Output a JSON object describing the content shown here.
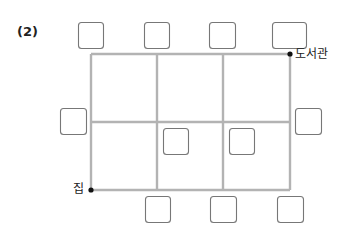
{
  "problem_number": "(2)",
  "places": {
    "start": "집",
    "end": "도서관"
  },
  "colors": {
    "grid_line": "#b3b3b3",
    "box_border": "#777777",
    "text": "#222222",
    "dot": "#111111"
  },
  "grid": {
    "columns": 3,
    "rows": 2,
    "x_lines": [
      91,
      157,
      223,
      290
    ],
    "y_lines": [
      54,
      122,
      190
    ]
  },
  "answer_boxes": [
    {
      "id": "top-1",
      "x": 78,
      "y": 22,
      "w": 25,
      "h": 26
    },
    {
      "id": "top-2",
      "x": 144,
      "y": 22,
      "w": 25,
      "h": 26
    },
    {
      "id": "top-3",
      "x": 209,
      "y": 22,
      "w": 26,
      "h": 26
    },
    {
      "id": "top-4",
      "x": 272,
      "y": 22,
      "w": 34,
      "h": 26
    },
    {
      "id": "left-1",
      "x": 60,
      "y": 108,
      "w": 26,
      "h": 26
    },
    {
      "id": "right-1",
      "x": 295,
      "y": 108,
      "w": 26,
      "h": 26
    },
    {
      "id": "inner-1",
      "x": 163,
      "y": 128,
      "w": 25,
      "h": 26
    },
    {
      "id": "inner-2",
      "x": 229,
      "y": 128,
      "w": 25,
      "h": 26
    },
    {
      "id": "bottom-1",
      "x": 145,
      "y": 196,
      "w": 25,
      "h": 26
    },
    {
      "id": "bottom-2",
      "x": 210,
      "y": 196,
      "w": 26,
      "h": 26
    },
    {
      "id": "bottom-3",
      "x": 277,
      "y": 196,
      "w": 26,
      "h": 26
    }
  ]
}
